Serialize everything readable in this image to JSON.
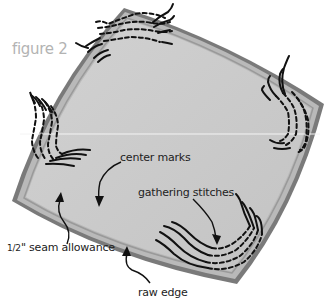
{
  "figure": {
    "title": "figure 2",
    "colors": {
      "raw_edge": "#7a7a7a",
      "seam_band": "#b4b4b4",
      "fabric_fill": "#c9c9c9",
      "stitch": "#111111",
      "title_text": "#b3b3b3",
      "label_text": "#222222"
    },
    "labels": {
      "center_marks": "center marks",
      "gathering_stitches": "gathering stitches",
      "seam_allowance_fraction": "1/2",
      "seam_allowance_unit": "\"",
      "seam_allowance_text": " seam allowance",
      "raw_edge": "raw edge"
    },
    "corners": [
      "top",
      "right",
      "bottom",
      "left"
    ]
  }
}
